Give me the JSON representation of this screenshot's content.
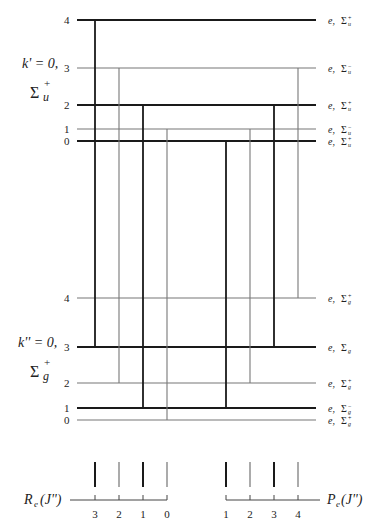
{
  "upper_state": {
    "label_k": "k' = 0,",
    "label_sigma": "Σ",
    "label_sup": "+",
    "label_sub": "u",
    "levels": [
      {
        "j": "0",
        "y": 141,
        "thick": true,
        "label_e": "e,",
        "label_sym": "Σ",
        "label_sub": "u",
        "label_sup": "+"
      },
      {
        "j": "1",
        "y": 129,
        "thick": false,
        "label_e": "e,",
        "label_sym": "Σ",
        "label_sub": "u",
        "label_sup": "−"
      },
      {
        "j": "2",
        "y": 105,
        "thick": true,
        "label_e": "e,",
        "label_sym": "Σ",
        "label_sub": "u",
        "label_sup": "+"
      },
      {
        "j": "3",
        "y": 68,
        "thick": false,
        "label_e": "e,",
        "label_sym": "Σ",
        "label_sub": "u",
        "label_sup": "−"
      },
      {
        "j": "4",
        "y": 20,
        "thick": true,
        "label_e": "e,",
        "label_sym": "Σ",
        "label_sub": "u",
        "label_sup": "+"
      }
    ]
  },
  "lower_state": {
    "label_k": "k'' = 0,",
    "label_sigma": "Σ",
    "label_sup": "+",
    "label_sub": "g",
    "levels": [
      {
        "j": "0",
        "y": 420,
        "thick": false,
        "label_e": "e,",
        "label_sym": "Σ",
        "label_sub": "g",
        "label_sup": "+"
      },
      {
        "j": "1",
        "y": 408,
        "thick": true,
        "label_e": "e,",
        "label_sym": "Σ",
        "label_sub": "g",
        "label_sup": "−"
      },
      {
        "j": "2",
        "y": 383,
        "thick": false,
        "label_e": "e,",
        "label_sym": "Σ",
        "label_sub": "g",
        "label_sup": "+"
      },
      {
        "j": "3",
        "y": 347,
        "thick": true,
        "label_e": "e,",
        "label_sym": "Σ",
        "label_sub": "g",
        "label_sup": ""
      },
      {
        "j": "4",
        "y": 298,
        "thick": false,
        "label_e": "e,",
        "label_sym": "Σ",
        "label_sub": "g",
        "label_sup": "+"
      }
    ]
  },
  "transitions": [
    {
      "branch": "R",
      "x": 95,
      "from_upper_j": "4",
      "to_lower_j": "3",
      "thick": true
    },
    {
      "branch": "R",
      "x": 119,
      "from_upper_j": "3",
      "to_lower_j": "2",
      "thick": false
    },
    {
      "branch": "R",
      "x": 143,
      "from_upper_j": "2",
      "to_lower_j": "1",
      "thick": true
    },
    {
      "branch": "R",
      "x": 167,
      "from_upper_j": "1",
      "to_lower_j": "0",
      "thick": false
    },
    {
      "branch": "P",
      "x": 226,
      "from_upper_j": "0",
      "to_lower_j": "1",
      "thick": true
    },
    {
      "branch": "P",
      "x": 250,
      "from_upper_j": "1",
      "to_lower_j": "2",
      "thick": false
    },
    {
      "branch": "P",
      "x": 274,
      "from_upper_j": "2",
      "to_lower_j": "3",
      "thick": true
    },
    {
      "branch": "P",
      "x": 298,
      "from_upper_j": "3",
      "to_lower_j": "4",
      "thick": false
    }
  ],
  "spectrum": {
    "r_branch": {
      "label_main": "R",
      "label_sub": "e",
      "label_arg": "(J'')",
      "ticks": [
        {
          "x": 95,
          "label": "3",
          "thick": true
        },
        {
          "x": 119,
          "label": "2",
          "thick": false
        },
        {
          "x": 143,
          "label": "1",
          "thick": true
        },
        {
          "x": 167,
          "label": "0",
          "thick": false
        }
      ]
    },
    "p_branch": {
      "label_main": "P",
      "label_sub": "e",
      "label_arg": "(J'')",
      "ticks": [
        {
          "x": 226,
          "label": "1",
          "thick": true
        },
        {
          "x": 250,
          "label": "2",
          "thick": false
        },
        {
          "x": 274,
          "label": "3",
          "thick": true
        },
        {
          "x": 298,
          "label": "4",
          "thick": false
        }
      ]
    }
  }
}
